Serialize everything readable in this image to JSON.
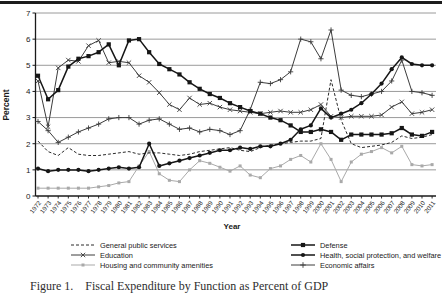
{
  "figure": {
    "caption": "Figure 1. Fiscal Expenditure by Function as Percent of GDP"
  },
  "chart_data": {
    "type": "line",
    "title": "",
    "xlabel": "Year",
    "ylabel": "Percent",
    "ylim": [
      0,
      7
    ],
    "yticks": [
      0,
      1,
      2,
      3,
      4,
      5,
      6,
      7
    ],
    "grid": true,
    "legend_position": "below",
    "x": [
      1972,
      1973,
      1974,
      1975,
      1976,
      1977,
      1978,
      1979,
      1980,
      1981,
      1982,
      1983,
      1984,
      1985,
      1986,
      1987,
      1988,
      1989,
      1990,
      1991,
      1992,
      1993,
      1994,
      1995,
      1996,
      1997,
      1998,
      1999,
      2000,
      2001,
      2002,
      2003,
      2004,
      2005,
      2006,
      2007,
      2008,
      2009,
      2010,
      2011
    ],
    "series": [
      {
        "id": "housing",
        "name": "Housing and community amenities",
        "marker": "square-small",
        "dash": false,
        "color": "#a9a9a9",
        "width": 1.0,
        "values": [
          0.3,
          0.3,
          0.3,
          0.3,
          0.3,
          0.3,
          0.35,
          0.4,
          0.5,
          0.55,
          1.15,
          1.7,
          0.85,
          0.6,
          0.55,
          1.0,
          1.35,
          1.25,
          1.1,
          0.95,
          1.15,
          0.8,
          0.7,
          1.05,
          1.15,
          1.4,
          1.55,
          1.3,
          2.0,
          1.4,
          0.55,
          1.3,
          1.6,
          1.7,
          1.85,
          1.65,
          1.9,
          1.2,
          1.15,
          1.2
        ]
      },
      {
        "id": "general-public-services",
        "name": "General public services",
        "marker": "none",
        "dash": true,
        "color": "#2a2a2a",
        "width": 1.0,
        "values": [
          2.1,
          1.7,
          1.55,
          1.85,
          1.6,
          1.55,
          1.55,
          1.6,
          1.65,
          1.7,
          1.6,
          1.65,
          1.65,
          1.6,
          1.55,
          1.6,
          1.7,
          1.75,
          1.8,
          1.85,
          1.75,
          1.7,
          1.85,
          1.95,
          2.0,
          2.05,
          2.1,
          2.1,
          2.2,
          4.45,
          2.9,
          2.0,
          1.85,
          1.9,
          1.95,
          2.05,
          2.3,
          2.2,
          2.25,
          2.35
        ]
      },
      {
        "id": "economic-affairs",
        "name": "Economic affairs",
        "marker": "plus",
        "dash": false,
        "color": "#3c3c3c",
        "width": 1.0,
        "values": [
          2.85,
          2.5,
          2.05,
          2.25,
          2.45,
          2.6,
          2.75,
          2.95,
          3.0,
          3.0,
          2.75,
          2.9,
          2.95,
          2.75,
          2.55,
          2.6,
          2.45,
          2.55,
          2.5,
          2.35,
          2.5,
          3.3,
          4.35,
          4.3,
          4.45,
          4.75,
          6.0,
          5.9,
          5.25,
          6.35,
          4.05,
          3.85,
          3.8,
          3.9,
          4.0,
          4.4,
          5.2,
          4.0,
          3.95,
          3.85
        ]
      },
      {
        "id": "education",
        "name": "Education",
        "marker": "x",
        "dash": false,
        "color": "#3c3c3c",
        "width": 1.0,
        "values": [
          4.4,
          2.65,
          4.9,
          5.2,
          5.15,
          5.75,
          5.95,
          5.1,
          5.15,
          5.1,
          4.6,
          4.35,
          3.95,
          3.5,
          3.3,
          3.75,
          3.5,
          3.55,
          3.4,
          3.3,
          3.25,
          3.2,
          3.15,
          3.2,
          3.25,
          3.2,
          3.2,
          3.3,
          3.5,
          3.05,
          3.0,
          3.05,
          3.05,
          3.05,
          3.1,
          3.4,
          3.6,
          3.15,
          3.2,
          3.3
        ]
      },
      {
        "id": "defense",
        "name": "Defense",
        "marker": "square",
        "dash": false,
        "color": "#161616",
        "width": 1.5,
        "values": [
          4.6,
          3.7,
          4.05,
          4.95,
          5.25,
          5.35,
          5.5,
          5.8,
          5.0,
          5.95,
          6.0,
          5.5,
          5.05,
          4.85,
          4.65,
          4.35,
          4.1,
          3.9,
          3.75,
          3.55,
          3.4,
          3.25,
          3.15,
          3.0,
          2.9,
          2.7,
          2.45,
          2.45,
          2.55,
          2.45,
          2.15,
          2.35,
          2.35,
          2.35,
          2.35,
          2.4,
          2.6,
          2.35,
          2.3,
          2.45
        ]
      },
      {
        "id": "health",
        "name": "Health, social protection, and welfare",
        "marker": "circle",
        "dash": false,
        "color": "#161616",
        "width": 1.5,
        "values": [
          1.05,
          0.95,
          1.0,
          1.0,
          1.0,
          0.95,
          1.0,
          1.05,
          1.1,
          1.05,
          1.1,
          2.0,
          1.15,
          1.25,
          1.35,
          1.45,
          1.55,
          1.65,
          1.75,
          1.75,
          1.85,
          1.8,
          1.9,
          1.9,
          2.0,
          2.15,
          2.55,
          2.7,
          3.35,
          3.0,
          3.15,
          3.3,
          3.55,
          3.9,
          4.3,
          4.85,
          5.3,
          5.05,
          5.0,
          5.0
        ]
      }
    ],
    "legend_columns": [
      [
        "general-public-services",
        "education",
        "housing"
      ],
      [
        "defense",
        "health",
        "economic-affairs"
      ]
    ]
  }
}
